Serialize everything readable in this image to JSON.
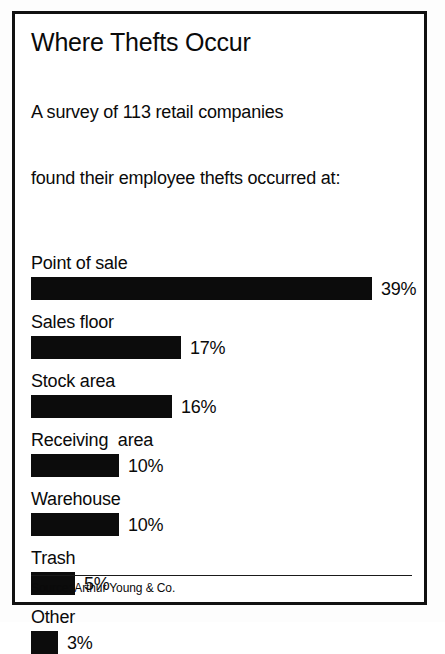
{
  "chart_data": {
    "type": "bar",
    "orientation": "horizontal",
    "title": "Where Thefts Occur",
    "subtitle_lines": [
      "A survey of 113 retail companies",
      "found their employee thefts occurred at:"
    ],
    "categories": [
      "Point of sale",
      "Sales floor",
      "Stock area",
      "Receiving  area",
      "Warehouse",
      "Trash",
      "Other"
    ],
    "values": [
      39,
      17,
      16,
      10,
      10,
      5,
      3
    ],
    "value_labels": [
      "39%",
      "17%",
      "16%",
      "10%",
      "10%",
      "5%",
      "3%"
    ],
    "bars": [
      {
        "label": "Point of sale",
        "value": 39,
        "value_label": "39%",
        "bar_px": 341
      },
      {
        "label": "Sales floor",
        "value": 17,
        "value_label": "17%",
        "bar_px": 150
      },
      {
        "label": "Stock area",
        "value": 16,
        "value_label": "16%",
        "bar_px": 141
      },
      {
        "label": "Receiving  area",
        "value": 10,
        "value_label": "10%",
        "bar_px": 88
      },
      {
        "label": "Warehouse",
        "value": 10,
        "value_label": "10%",
        "bar_px": 88
      },
      {
        "label": "Trash",
        "value": 5,
        "value_label": "5%",
        "bar_px": 44
      },
      {
        "label": "Other",
        "value": 3,
        "value_label": "3%",
        "bar_px": 27
      }
    ],
    "unit": "%",
    "xlabel": "",
    "ylabel": "",
    "xlim": [
      0,
      39
    ],
    "grid": false,
    "legend": false,
    "bar_color": "#0c0c0c",
    "background_color": "#ffffff",
    "text_color": "#0a0a0a"
  },
  "source": {
    "text": "Source: Arthur Young & Co."
  }
}
